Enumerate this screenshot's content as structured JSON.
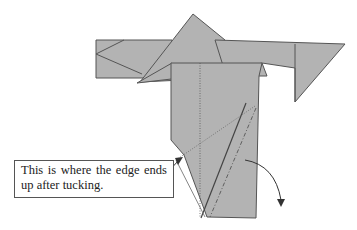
{
  "diagram": {
    "paper_color": "#b3b3b3",
    "line_color": "#555555",
    "callout": {
      "text": "This is where the edge ends up after tucking."
    }
  }
}
